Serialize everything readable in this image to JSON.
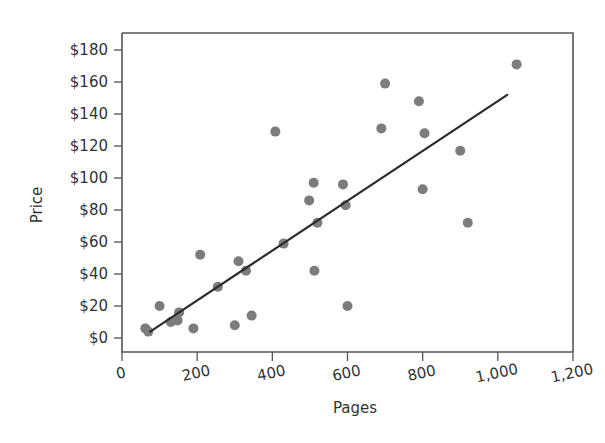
{
  "chart_data": {
    "type": "scatter",
    "title": "",
    "xlabel": "Pages",
    "ylabel": "Price",
    "xlim": [
      0,
      1200
    ],
    "ylim": [
      0,
      190
    ],
    "grid": false,
    "legend": null,
    "xticks": [
      0,
      200,
      400,
      600,
      800,
      1000,
      1200
    ],
    "xtick_labels": [
      "0",
      "200",
      "400",
      "600",
      "800",
      "1,000",
      "1,200"
    ],
    "yticks": [
      0,
      20,
      40,
      60,
      80,
      100,
      120,
      140,
      160,
      180
    ],
    "ytick_labels": [
      "$0",
      "$20",
      "$40",
      "$60",
      "$80",
      "$100",
      "$120",
      "$140",
      "$160",
      "$180"
    ],
    "marker_color": "#7c7c7c",
    "marker_size": 9,
    "trendline": {
      "type": "linear",
      "x_start": 75,
      "y_start": 4,
      "x_end": 1025,
      "y_end": 152,
      "color": "#2b2b2b"
    },
    "points": [
      {
        "x": 62,
        "y": 6
      },
      {
        "x": 70,
        "y": 4
      },
      {
        "x": 100,
        "y": 20
      },
      {
        "x": 130,
        "y": 10
      },
      {
        "x": 148,
        "y": 11
      },
      {
        "x": 152,
        "y": 16
      },
      {
        "x": 190,
        "y": 6
      },
      {
        "x": 208,
        "y": 52
      },
      {
        "x": 255,
        "y": 32
      },
      {
        "x": 300,
        "y": 8
      },
      {
        "x": 310,
        "y": 48
      },
      {
        "x": 330,
        "y": 42
      },
      {
        "x": 345,
        "y": 14
      },
      {
        "x": 408,
        "y": 129
      },
      {
        "x": 430,
        "y": 59
      },
      {
        "x": 498,
        "y": 86
      },
      {
        "x": 510,
        "y": 97
      },
      {
        "x": 512,
        "y": 42
      },
      {
        "x": 520,
        "y": 72
      },
      {
        "x": 588,
        "y": 96
      },
      {
        "x": 595,
        "y": 83
      },
      {
        "x": 600,
        "y": 20
      },
      {
        "x": 690,
        "y": 131
      },
      {
        "x": 700,
        "y": 159
      },
      {
        "x": 790,
        "y": 148
      },
      {
        "x": 800,
        "y": 93
      },
      {
        "x": 805,
        "y": 128
      },
      {
        "x": 900,
        "y": 117
      },
      {
        "x": 920,
        "y": 72
      },
      {
        "x": 1050,
        "y": 171
      }
    ]
  },
  "axes": {
    "y_label": "Price",
    "x_label": "Pages"
  }
}
